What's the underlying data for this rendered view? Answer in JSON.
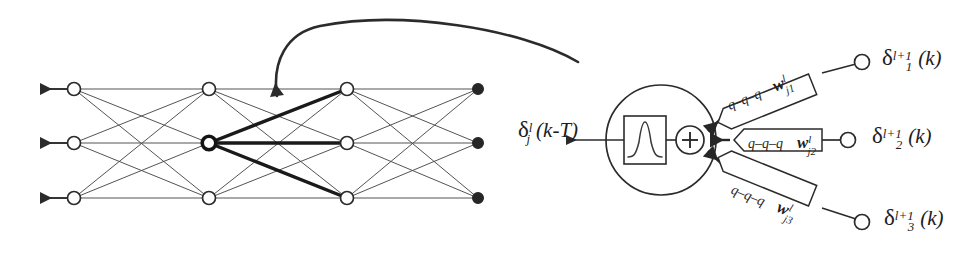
{
  "figure": {
    "caption_visible": false,
    "background_color": "#ffffff",
    "ink_color": "#2b2b2b",
    "bold_ink_color": "#1a1a1a"
  },
  "network": {
    "name": "backpropagation-network",
    "layer_count": 4,
    "nodes_per_layer": 3,
    "layers": [
      {
        "index": 0,
        "x": 74,
        "node_style": "hollow",
        "has_output_arrow": true
      },
      {
        "index": 1,
        "x": 209,
        "node_style": "hollow",
        "has_output_arrow": false
      },
      {
        "index": 2,
        "x": 347,
        "node_style": "hollow",
        "has_output_arrow": false
      },
      {
        "index": 3,
        "x": 478,
        "node_style": "filled",
        "has_output_arrow": false
      }
    ],
    "row_y": [
      89,
      143,
      198
    ],
    "highlighted_node": {
      "layer": 1,
      "row": 1,
      "x": 209,
      "y": 143
    },
    "highlighted_edges_label": "bold fan from highlighted node to all layer-3 nodes"
  },
  "annotation_arrow": {
    "name": "zoom-callout-arrow",
    "description": "curved arrow pointing from the neuron detail to the highlighted network node",
    "start_x": 578,
    "start_y": 62,
    "end_x": 278,
    "end_y": 107
  },
  "neuron": {
    "name": "neuron-detail",
    "body": {
      "cx": 661,
      "cy": 140,
      "r": 55
    },
    "activation_box": {
      "label_icon": "bell-curve-icon",
      "x": 624,
      "y": 116,
      "width": 42,
      "height": 48
    },
    "summation": {
      "cx": 690,
      "cy": 140,
      "r": 14,
      "glyph": "+"
    },
    "output_label": {
      "sym": "δ",
      "sup": "l",
      "sub": "j",
      "arg": "(k-T)",
      "full": "δⱼᴸ(k-T)"
    },
    "input_count": 3
  },
  "weights": [
    {
      "name": "weight-branch-1",
      "qchain": "q–q–q",
      "wsym": "w",
      "wsup": "l",
      "wsub": "j1",
      "delta": {
        "sym": "δ",
        "sup": "l+1",
        "sub": "1",
        "arg": "(k)"
      },
      "node_cx": 862,
      "node_cy": 62,
      "label_x": 882,
      "label_y": 48
    },
    {
      "name": "weight-branch-2",
      "qchain": "q–q–q",
      "wsym": "w",
      "wsup": "l",
      "wsub": "j2",
      "delta": {
        "sym": "δ",
        "sup": "l+1",
        "sub": "2",
        "arg": "(k)"
      },
      "node_cx": 848,
      "node_cy": 140,
      "label_x": 872,
      "label_y": 126
    },
    {
      "name": "weight-branch-3",
      "qchain": "q–q–q",
      "wsym": "w",
      "wsup": "l",
      "wsub": "j3",
      "delta": {
        "sym": "δ",
        "sup": "l+1",
        "sub": "3",
        "arg": "(k)"
      },
      "node_cx": 862,
      "node_cy": 222,
      "label_x": 884,
      "label_y": 208
    }
  ]
}
